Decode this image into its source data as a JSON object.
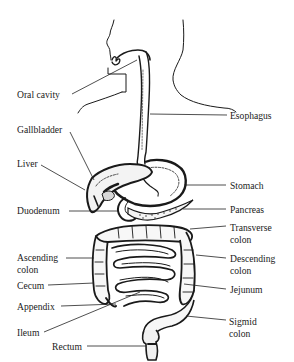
{
  "diagram": {
    "labels": {
      "oral_cavity": "Oral cavity",
      "esophagus": "Esophagus",
      "gallbladder": "Gallbladder",
      "liver": "Liver",
      "stomach": "Stomach",
      "duodenum": "Duodenum",
      "pancreas": "Pancreas",
      "transverse_colon_1": "Transverse",
      "transverse_colon_2": "colon",
      "ascending_colon_1": "Ascending",
      "ascending_colon_2": "colon",
      "descending_colon_1": "Descending",
      "descending_colon_2": "colon",
      "cecum": "Cecum",
      "jejunum": "Jejunum",
      "appendix": "Appendix",
      "ileum": "Ileum",
      "sigmoid_colon_1": "Sigmid",
      "sigmoid_colon_2": "colon",
      "rectum": "Rectum"
    },
    "colors": {
      "ink": "#1a1a1a",
      "background": "#ffffff"
    }
  }
}
